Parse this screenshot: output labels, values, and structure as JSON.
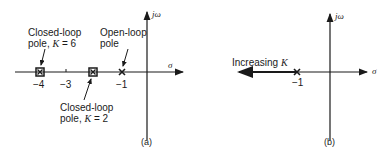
{
  "figure": {
    "panel_a": {
      "caption": "(a)",
      "axis_x_label": "σ",
      "axis_y_label": "jω",
      "ticks": [
        "−4",
        "−3",
        "−1"
      ],
      "annotations": {
        "cl_k6_line1": "Closed-loop",
        "cl_k6_line2": "pole, ",
        "cl_k6_k": "K",
        "cl_k6_val": " = 6",
        "ol_line1": "Open-loop",
        "ol_line2": "pole",
        "cl_k2_line1": "Closed-loop",
        "cl_k2_line2": "pole, ",
        "cl_k2_k": "K",
        "cl_k2_val": " = 2"
      },
      "points": [
        {
          "name": "closed-loop pole K=6",
          "sigma": -4,
          "marker": "square"
        },
        {
          "name": "closed-loop pole K=2",
          "sigma": -2,
          "marker": "square"
        },
        {
          "name": "open-loop pole",
          "sigma": -1,
          "marker": "x"
        }
      ]
    },
    "panel_b": {
      "caption": "(b)",
      "axis_x_label": "σ",
      "axis_y_label": "jω",
      "tick": "−1",
      "annotation_text": "Increasing ",
      "annotation_k": "K",
      "points": [
        {
          "name": "open-loop pole",
          "sigma": -1,
          "marker": "x"
        }
      ],
      "locus": "real axis from −1 toward −∞"
    }
  }
}
